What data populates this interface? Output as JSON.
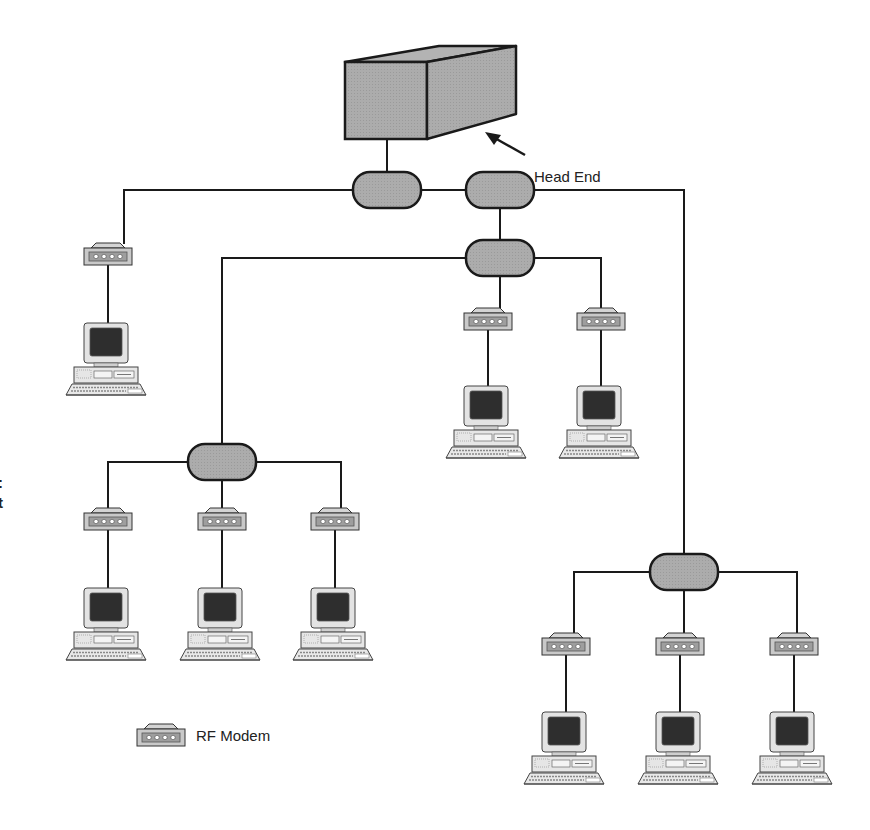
{
  "diagram": {
    "title": "",
    "labels": {
      "head_end": "Head End",
      "legend_rf_modem": "RF Modem",
      "left_edge_fragment_1": ":",
      "left_edge_fragment_2": "t"
    },
    "colors": {
      "line": "#1a1a1a",
      "fill_gray": "#a9a9a9",
      "fill_light": "#d6d6d6",
      "screen": "#2e2e2e",
      "background": "#ffffff"
    },
    "nodes": {
      "head_end": {
        "type": "head-end-box",
        "label": "Head End"
      },
      "splitters": [
        {
          "id": "splitter-1",
          "x": 387,
          "y": 190
        },
        {
          "id": "splitter-2",
          "x": 500,
          "y": 190
        },
        {
          "id": "splitter-3",
          "x": 500,
          "y": 258
        },
        {
          "id": "splitter-4",
          "x": 222,
          "y": 462
        },
        {
          "id": "splitter-5",
          "x": 684,
          "y": 572
        }
      ],
      "modems": [
        {
          "id": "modem-1",
          "x": 108,
          "y": 257
        },
        {
          "id": "modem-2",
          "x": 488,
          "y": 322
        },
        {
          "id": "modem-3",
          "x": 601,
          "y": 322
        },
        {
          "id": "modem-4",
          "x": 108,
          "y": 522
        },
        {
          "id": "modem-5",
          "x": 222,
          "y": 522
        },
        {
          "id": "modem-6",
          "x": 335,
          "y": 522
        },
        {
          "id": "modem-7",
          "x": 566,
          "y": 647
        },
        {
          "id": "modem-8",
          "x": 680,
          "y": 647
        },
        {
          "id": "modem-9",
          "x": 794,
          "y": 647
        }
      ],
      "computers": [
        {
          "id": "pc-1",
          "x": 108,
          "y": 325
        },
        {
          "id": "pc-2",
          "x": 488,
          "y": 388
        },
        {
          "id": "pc-3",
          "x": 601,
          "y": 388
        },
        {
          "id": "pc-4",
          "x": 108,
          "y": 590
        },
        {
          "id": "pc-5",
          "x": 222,
          "y": 590
        },
        {
          "id": "pc-6",
          "x": 335,
          "y": 590
        },
        {
          "id": "pc-7",
          "x": 566,
          "y": 714
        },
        {
          "id": "pc-8",
          "x": 680,
          "y": 714
        },
        {
          "id": "pc-9",
          "x": 794,
          "y": 714
        }
      ]
    },
    "edges": [
      [
        "head_end",
        "splitter-1"
      ],
      [
        "splitter-1",
        "splitter-2"
      ],
      [
        "splitter-1",
        "modem-1"
      ],
      [
        "splitter-2",
        "splitter-3"
      ],
      [
        "splitter-2",
        "splitter-5"
      ],
      [
        "splitter-3",
        "splitter-4"
      ],
      [
        "splitter-3",
        "modem-2"
      ],
      [
        "splitter-3",
        "modem-3"
      ],
      [
        "splitter-4",
        "modem-4"
      ],
      [
        "splitter-4",
        "modem-5"
      ],
      [
        "splitter-4",
        "modem-6"
      ],
      [
        "splitter-5",
        "modem-7"
      ],
      [
        "splitter-5",
        "modem-8"
      ],
      [
        "splitter-5",
        "modem-9"
      ],
      [
        "modem-1",
        "pc-1"
      ],
      [
        "modem-2",
        "pc-2"
      ],
      [
        "modem-3",
        "pc-3"
      ],
      [
        "modem-4",
        "pc-4"
      ],
      [
        "modem-5",
        "pc-5"
      ],
      [
        "modem-6",
        "pc-6"
      ],
      [
        "modem-7",
        "pc-7"
      ],
      [
        "modem-8",
        "pc-8"
      ],
      [
        "modem-9",
        "pc-9"
      ]
    ],
    "legend": [
      {
        "icon": "rf-modem-icon",
        "label": "RF Modem"
      }
    ]
  }
}
